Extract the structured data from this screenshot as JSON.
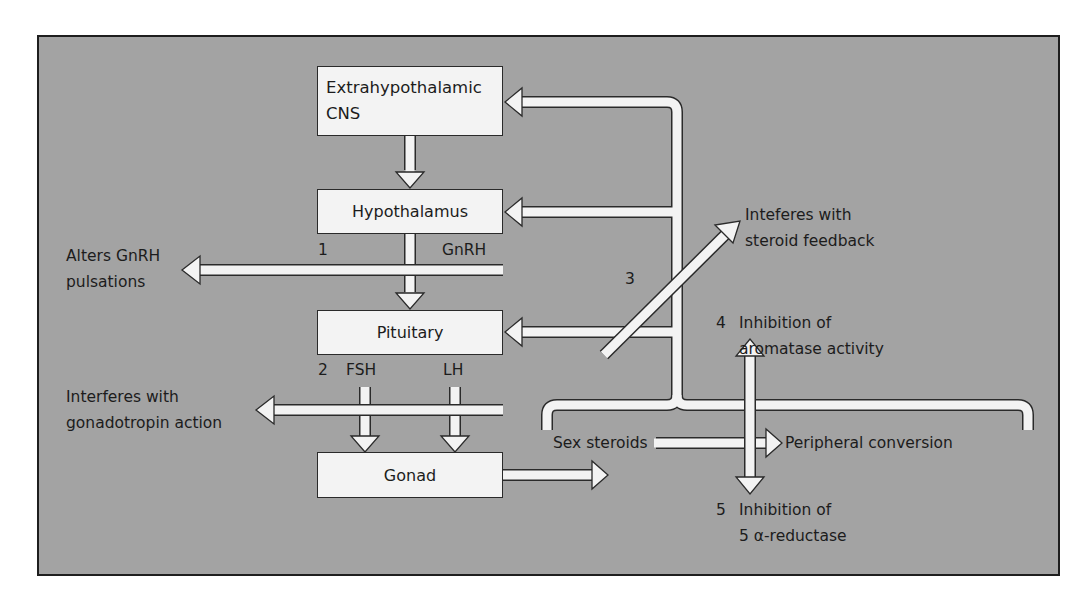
{
  "diagram": {
    "boxes": {
      "extrahypothalamic": {
        "line1": "Extrahypothalamic",
        "line2": "CNS"
      },
      "hypothalamus": "Hypothalamus",
      "pituitary": "Pituitary",
      "gonad": "Gonad"
    },
    "hormones": {
      "gnrh": "GnRH",
      "fsh": "FSH",
      "lh": "LH"
    },
    "markers": {
      "m1": "1",
      "m2": "2",
      "m3": "3",
      "m4": "4",
      "m5": "5"
    },
    "labels": {
      "alters_line1": "Alters GnRH",
      "alters_line2": "pulsations",
      "gonadotropin_line1": "Interferes with",
      "gonadotropin_line2": "gonadotropin action",
      "steroid_feedback_line1": "Inteferes with",
      "steroid_feedback_line2": "steroid feedback",
      "aromatase_line1": "Inhibition of",
      "aromatase_line2": "aromatase activity",
      "reductase_line1": "Inhibition of",
      "reductase_line2": "5 α-reductase",
      "sex_steroids": "Sex steroids",
      "peripheral_conversion": "Peripheral conversion"
    },
    "colors": {
      "background": "#a3a3a3",
      "box_fill": "#f3f3f3",
      "outline": "#2a2a2a",
      "text": "#1c1c1c"
    }
  }
}
